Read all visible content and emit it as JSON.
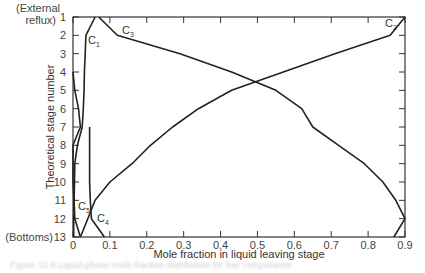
{
  "chart_data": {
    "type": "line",
    "title": "",
    "xlabel": "Mole fraction in liquid leaving stage",
    "ylabel": "Theoretical stage number",
    "xlim": [
      0,
      0.9
    ],
    "ylim": [
      13,
      1
    ],
    "x_ticks": [
      "0",
      "0.1",
      "0.2",
      "0.3",
      "0.4",
      "0.5",
      "0.6",
      "0.7",
      "0.8",
      "0.9"
    ],
    "y_ticks": [
      "1",
      "2",
      "3",
      "4",
      "5",
      "6",
      "7",
      "8",
      "9",
      "10",
      "11",
      "12",
      "13"
    ],
    "y_tick_annotations": {
      "top": "(External reflux)",
      "bottom": "(Bottoms)"
    },
    "grid": false,
    "stages": [
      1,
      2,
      3,
      4,
      5,
      6,
      7,
      8,
      9,
      10,
      11,
      12,
      13
    ],
    "series": [
      {
        "name": "C1",
        "values": [
          0.06,
          0.035,
          0.033,
          0.031,
          0.03,
          0.028,
          0.025,
          0.012,
          0.005,
          0.004,
          0.003,
          0.002,
          0.002
        ]
      },
      {
        "name": "C2",
        "values": [
          0.9,
          0.86,
          0.71,
          0.57,
          0.43,
          0.34,
          0.27,
          0.21,
          0.16,
          0.1,
          0.06,
          0.04,
          0.02
        ]
      },
      {
        "name": "C3",
        "values": [
          0.07,
          0.12,
          0.29,
          0.43,
          0.55,
          0.62,
          0.65,
          0.72,
          0.79,
          0.84,
          0.875,
          0.9,
          0.87
        ]
      },
      {
        "name": "C4",
        "values": [
          null,
          null,
          null,
          null,
          null,
          null,
          0.045,
          0.045,
          0.045,
          0.045,
          0.047,
          0.05,
          0.085
        ]
      },
      {
        "name": "C5",
        "values": [
          null,
          null,
          null,
          0.0,
          0.005,
          0.015,
          0.02,
          0.0,
          0.0,
          0.0,
          0.003,
          0.005,
          0.02
        ]
      }
    ]
  },
  "labels": {
    "c1": "C",
    "c1_sub": "1",
    "c2": "C",
    "c2_sub": "2",
    "c3": "C",
    "c3_sub": "3",
    "c4": "C",
    "c4_sub": "4",
    "c5": "C",
    "c5_sub": "5",
    "external": "(External",
    "reflux": "reflux)",
    "bottoms": "(Bottoms)",
    "ylabel": "Theoretical stage number",
    "xlabel": "Mole fraction in liquid leaving stage",
    "caption": "Figure 10.8 Liquid-phase mole-fraction distribution for five components"
  }
}
